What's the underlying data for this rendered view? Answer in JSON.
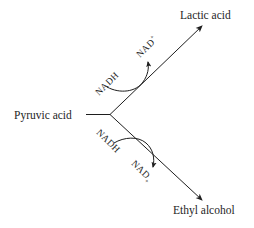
{
  "diagram": {
    "type": "metabolic-pathway-branch",
    "colors": {
      "ink": "#1e1e1e",
      "background": "#ffffff"
    },
    "nodes": {
      "source": {
        "label": "Pyruvic acid"
      },
      "upper_product": {
        "label": "Lactic acid"
      },
      "lower_product": {
        "label": "Ethyl alcohol"
      }
    },
    "upper_branch": {
      "cofactor_in": "NADH",
      "cofactor_out": "NAD",
      "cofactor_out_superscript": "+"
    },
    "lower_branch": {
      "cofactor_in": "NADH",
      "cofactor_out": "NAD",
      "cofactor_out_superscript": "+"
    }
  }
}
